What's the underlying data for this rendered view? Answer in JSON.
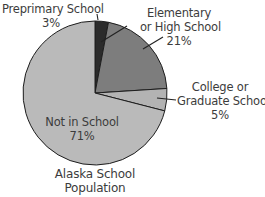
{
  "chart_data": {
    "type": "pie",
    "title": "Alaska School Population",
    "title_lines": [
      "Alaska School",
      "Population"
    ],
    "start_angle_deg": 0,
    "direction": "clockwise",
    "slices": [
      {
        "label": "Preprimary School",
        "label_lines": [
          "Preprimary School"
        ],
        "value": 3,
        "value_label": "3%",
        "color": "#2b2b2b"
      },
      {
        "label": "Elementary or High School",
        "label_lines": [
          "Elementary",
          "or High School"
        ],
        "value": 21,
        "value_label": "21%",
        "color": "#7d7d7d"
      },
      {
        "label": "College or Graduate School",
        "label_lines": [
          "College or",
          "Graduate School"
        ],
        "value": 5,
        "value_label": "5%",
        "color": "#b3b3b3"
      },
      {
        "label": "Not in School",
        "label_lines": [
          "Not in School"
        ],
        "value": 71,
        "value_label": "71%",
        "color": "#bababa"
      }
    ],
    "legend": "none (callout labels)",
    "units": "percent"
  }
}
